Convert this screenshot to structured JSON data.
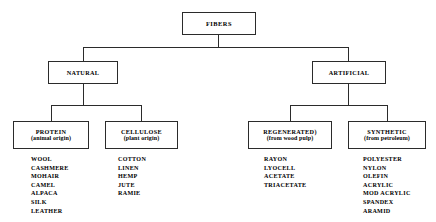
{
  "diagram": {
    "type": "hierarchy-tree",
    "root": {
      "id": "fibers",
      "title": "FIBERS"
    },
    "level1": [
      {
        "id": "natural",
        "title": "NATURAL"
      },
      {
        "id": "artificial",
        "title": "ARTIFICIAL"
      }
    ],
    "level2": [
      {
        "id": "protein",
        "title": "PROTEIN",
        "subtitle": "(animal origin)",
        "items": [
          "WOOL",
          "CASHMERE",
          "MOHAIR",
          "CAMEL",
          "ALPACA",
          "SILK",
          "LEATHER"
        ]
      },
      {
        "id": "cellulose",
        "title": "CELLULOSE",
        "subtitle": "(plant origin)",
        "items": [
          "COTTON",
          "LINEN",
          "HEMP",
          "JUTE",
          "RAMIE"
        ]
      },
      {
        "id": "regenerated",
        "title": "REGENERATED)",
        "subtitle": "(from wood pulp)",
        "items": [
          "RAYON",
          "LYOCELL",
          "ACETATE",
          "TRIACETATE"
        ]
      },
      {
        "id": "synthetic",
        "title": "SYNTHETIC",
        "subtitle": "(from petroleum)",
        "items": [
          "POLYESTER",
          "NYLON",
          "OLEFIN",
          "ACRYLIC",
          "MOD ACRYLIC",
          "SPANDEX",
          "ARAMID"
        ]
      }
    ],
    "colors": {
      "line": "#2b2b2b",
      "text": "#000000",
      "background": "#ffffff"
    }
  }
}
